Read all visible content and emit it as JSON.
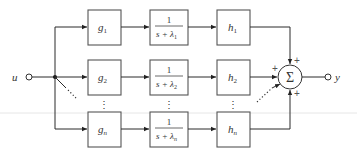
{
  "diagram": {
    "input": {
      "label": "u"
    },
    "output": {
      "label": "y"
    },
    "summer": {
      "symbol": "Σ",
      "signs": [
        "+",
        "+",
        "+"
      ]
    },
    "rows": [
      {
        "g": {
          "base": "g",
          "sub": "1"
        },
        "tf": {
          "num": "1",
          "den": "s + λ",
          "sub": "1"
        },
        "h": {
          "base": "h",
          "sub": "1"
        }
      },
      {
        "g": {
          "base": "g",
          "sub": "2"
        },
        "tf": {
          "num": "1",
          "den": "s + λ",
          "sub": "2"
        },
        "h": {
          "base": "h",
          "sub": "2"
        }
      },
      {
        "g": {
          "base": "g",
          "sub": "n"
        },
        "tf": {
          "num": "1",
          "den": "s + λ",
          "sub": "n"
        },
        "h": {
          "base": "h",
          "sub": "n"
        }
      }
    ],
    "ellipsis": "⋮"
  }
}
